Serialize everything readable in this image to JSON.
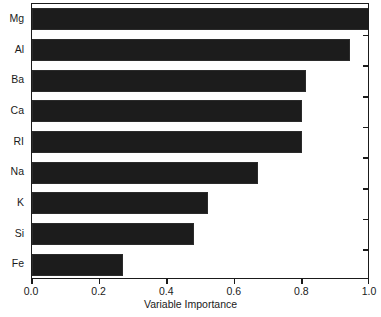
{
  "chart_data": {
    "type": "bar",
    "orientation": "horizontal",
    "title": "",
    "xlabel": "Variable Importance",
    "ylabel": "",
    "categories": [
      "Mg",
      "Al",
      "Ba",
      "Ca",
      "RI",
      "Na",
      "K",
      "Si",
      "Fe"
    ],
    "values": [
      1.0,
      0.94,
      0.81,
      0.8,
      0.8,
      0.67,
      0.52,
      0.48,
      0.27
    ],
    "xlim": [
      0.0,
      1.0
    ],
    "xticks": [
      0.0,
      0.2,
      0.4,
      0.6,
      0.8,
      1.0
    ],
    "xtick_labels": [
      "0.0",
      "0.2",
      "0.4",
      "0.6",
      "0.8",
      "1.0"
    ],
    "grid": false,
    "legend": null,
    "bar_color": "#1c1c1c",
    "axis_color": "#1a1a1a",
    "background": "#ffffff"
  },
  "axes": {
    "x_title": "Variable Importance"
  }
}
